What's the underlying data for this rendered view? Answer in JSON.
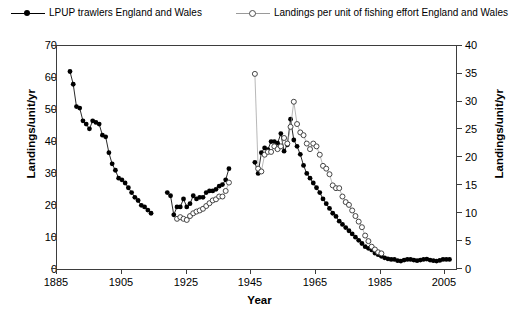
{
  "legend": {
    "entries": [
      {
        "label": "LPUP trawlers England and Wales",
        "marker": "filled-circle-line",
        "color": "#000000"
      },
      {
        "label": "Landings per unit of fishing effort England and Wales",
        "marker": "open-circle-line",
        "color": "#9a9a9a"
      }
    ]
  },
  "axes": {
    "left": {
      "title": "Landings/unit/yr",
      "ticks": [
        "0",
        "10",
        "20",
        "30",
        "40",
        "50",
        "60",
        "70"
      ]
    },
    "right": {
      "title": "Landings/unit/yr",
      "ticks": [
        "0",
        "5",
        "10",
        "15",
        "20",
        "25",
        "30",
        "35",
        "40"
      ]
    },
    "bottom": {
      "title": "Year",
      "ticks": [
        "1885",
        "1905",
        "1925",
        "1945",
        "1965",
        "1985",
        "2005"
      ]
    }
  },
  "chart_data": {
    "type": "line",
    "title": "",
    "xlabel": "Year",
    "ylabel": "Landings/unit/yr",
    "y2label": "Landings/unit/yr",
    "xlim": [
      1885,
      2008
    ],
    "ylim": [
      0,
      70
    ],
    "y2lim": [
      0,
      40
    ],
    "grid": false,
    "legend_position": "top",
    "series": [
      {
        "name": "LPUP trawlers England and Wales",
        "axis": "left",
        "marker": "filled-circle",
        "color": "#000000",
        "x": [
          1889,
          1890,
          1891,
          1892,
          1893,
          1894,
          1895,
          1896,
          1897,
          1898,
          1899,
          1900,
          1901,
          1902,
          1903,
          1904,
          1905,
          1906,
          1907,
          1908,
          1909,
          1910,
          1911,
          1912,
          1913,
          1914,
          1919,
          1920,
          1921,
          1922,
          1923,
          1924,
          1925,
          1926,
          1927,
          1928,
          1929,
          1930,
          1931,
          1932,
          1933,
          1934,
          1935,
          1936,
          1937,
          1938,
          1946,
          1947,
          1948,
          1949,
          1950,
          1951,
          1952,
          1953,
          1954,
          1955,
          1956,
          1957,
          1958,
          1959,
          1960,
          1961,
          1962,
          1963,
          1964,
          1965,
          1966,
          1967,
          1968,
          1969,
          1970,
          1971,
          1972,
          1973,
          1974,
          1975,
          1976,
          1977,
          1978,
          1979,
          1980,
          1981,
          1982,
          1983,
          1984,
          1985,
          1986,
          1987,
          1988,
          1989,
          1990,
          1991,
          1992,
          1993,
          1994,
          1995,
          1996,
          1997,
          1998,
          1999,
          2000,
          2001,
          2002,
          2003,
          2004,
          2005,
          2006
        ],
        "y": [
          62.0,
          58.0,
          51.0,
          50.5,
          46.5,
          45.5,
          44.0,
          46.5,
          46.0,
          45.5,
          42.0,
          41.5,
          36.5,
          33.0,
          31.0,
          28.5,
          28.0,
          27.0,
          25.5,
          24.0,
          22.5,
          21.5,
          20.0,
          19.5,
          18.5,
          17.5,
          24.0,
          23.0,
          17.0,
          19.5,
          19.5,
          22.0,
          19.5,
          20.5,
          23.0,
          22.0,
          22.5,
          22.5,
          24.0,
          24.5,
          24.5,
          25.0,
          26.0,
          26.5,
          28.0,
          31.5,
          33.5,
          30.0,
          36.5,
          38.0,
          37.5,
          40.0,
          40.0,
          39.5,
          42.5,
          37.0,
          39.0,
          47.0,
          40.5,
          38.5,
          36.0,
          32.5,
          30.0,
          28.5,
          27.0,
          25.5,
          24.0,
          22.0,
          20.5,
          19.0,
          17.5,
          16.5,
          15.0,
          14.0,
          13.0,
          12.0,
          11.0,
          10.0,
          9.0,
          8.0,
          7.0,
          6.5,
          6.0,
          5.0,
          4.5,
          4.0,
          3.5,
          3.2,
          3.0,
          3.0,
          2.6,
          2.5,
          2.8,
          3.0,
          3.0,
          2.8,
          2.6,
          2.8,
          3.0,
          3.1,
          2.8,
          2.6,
          2.5,
          2.7,
          3.0,
          3.0,
          3.0
        ]
      },
      {
        "name": "Landings per unit of fishing effort England and Wales",
        "axis": "right",
        "marker": "open-circle",
        "color": "#4d4d4d",
        "x": [
          1922,
          1923,
          1924,
          1925,
          1926,
          1927,
          1928,
          1929,
          1930,
          1931,
          1932,
          1933,
          1934,
          1935,
          1936,
          1937,
          1938,
          1946,
          1947,
          1948,
          1949,
          1950,
          1951,
          1952,
          1953,
          1954,
          1955,
          1956,
          1957,
          1958,
          1959,
          1960,
          1961,
          1962,
          1963,
          1964,
          1965,
          1966,
          1967,
          1968,
          1969,
          1970,
          1971,
          1972,
          1973,
          1974,
          1975,
          1976,
          1977,
          1978,
          1979,
          1980,
          1981,
          1982,
          1983,
          1984,
          1985
        ],
        "y": [
          9.0,
          9.3,
          9.0,
          8.8,
          9.5,
          10.0,
          10.3,
          10.5,
          10.8,
          11.3,
          11.8,
          12.3,
          12.5,
          13.0,
          13.0,
          14.0,
          15.5,
          35.0,
          18.0,
          17.5,
          20.5,
          21.0,
          21.0,
          22.0,
          21.5,
          22.0,
          23.5,
          22.5,
          25.5,
          30.0,
          26.0,
          24.5,
          24.0,
          22.5,
          21.5,
          22.5,
          22.0,
          20.5,
          18.5,
          18.0,
          17.0,
          15.0,
          14.5,
          14.5,
          13.0,
          12.0,
          11.5,
          10.5,
          9.5,
          8.5,
          7.5,
          6.0,
          5.0,
          4.0,
          3.5,
          3.0,
          2.8
        ]
      }
    ]
  }
}
